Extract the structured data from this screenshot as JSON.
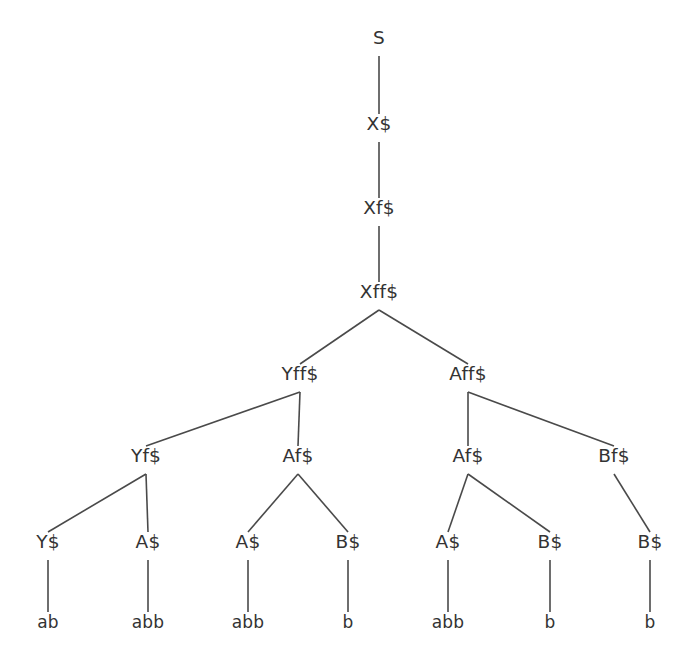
{
  "figure": {
    "type": "derivation-tree",
    "title": "",
    "background_color": "#ffffff",
    "text_color": "#333333",
    "edge_color": "#4a4a4a",
    "width": 687,
    "height": 662
  },
  "tree": {
    "levels": [
      {
        "index": 0,
        "y": 44,
        "nodes": [
          {
            "id": "n0",
            "label": "S",
            "x": 379
          }
        ]
      },
      {
        "index": 1,
        "y": 130,
        "nodes": [
          {
            "id": "n1",
            "label": "X$",
            "x": 379
          }
        ]
      },
      {
        "index": 2,
        "y": 214,
        "nodes": [
          {
            "id": "n2",
            "label": "Xf$",
            "x": 379
          }
        ]
      },
      {
        "index": 3,
        "y": 298,
        "nodes": [
          {
            "id": "n3",
            "label": "Xff$",
            "x": 379
          }
        ]
      },
      {
        "index": 4,
        "y": 380,
        "nodes": [
          {
            "id": "n4",
            "label": "Yff$",
            "x": 300
          },
          {
            "id": "n5",
            "label": "Aff$",
            "x": 468
          }
        ]
      },
      {
        "index": 5,
        "y": 462,
        "nodes": [
          {
            "id": "n6",
            "label": "Yf$",
            "x": 146
          },
          {
            "id": "n7",
            "label": "Af$",
            "x": 298
          },
          {
            "id": "n8",
            "label": "Af$",
            "x": 468
          },
          {
            "id": "n9",
            "label": "Bf$",
            "x": 614
          }
        ]
      },
      {
        "index": 6,
        "y": 548,
        "nodes": [
          {
            "id": "n10",
            "label": "Y$",
            "x": 48
          },
          {
            "id": "n11",
            "label": "A$",
            "x": 148
          },
          {
            "id": "n12",
            "label": "A$",
            "x": 248
          },
          {
            "id": "n13",
            "label": "B$",
            "x": 348
          },
          {
            "id": "n14",
            "label": "A$",
            "x": 448
          },
          {
            "id": "n15",
            "label": "B$",
            "x": 550
          },
          {
            "id": "n16",
            "label": "B$",
            "x": 650
          }
        ]
      },
      {
        "index": 7,
        "y": 628,
        "nodes": [
          {
            "id": "n17",
            "label": "ab",
            "x": 48
          },
          {
            "id": "n18",
            "label": "abb",
            "x": 148
          },
          {
            "id": "n19",
            "label": "abb",
            "x": 248
          },
          {
            "id": "n20",
            "label": "b",
            "x": 348
          },
          {
            "id": "n21",
            "label": "abb",
            "x": 448
          },
          {
            "id": "n22",
            "label": "b",
            "x": 550
          },
          {
            "id": "n23",
            "label": "b",
            "x": 650
          }
        ]
      }
    ],
    "edges": [
      {
        "from": "n0",
        "to": "n1"
      },
      {
        "from": "n1",
        "to": "n2"
      },
      {
        "from": "n2",
        "to": "n3"
      },
      {
        "from": "n3",
        "to": "n4"
      },
      {
        "from": "n3",
        "to": "n5"
      },
      {
        "from": "n4",
        "to": "n6"
      },
      {
        "from": "n4",
        "to": "n7"
      },
      {
        "from": "n5",
        "to": "n8"
      },
      {
        "from": "n5",
        "to": "n9"
      },
      {
        "from": "n6",
        "to": "n10"
      },
      {
        "from": "n6",
        "to": "n11"
      },
      {
        "from": "n7",
        "to": "n12"
      },
      {
        "from": "n7",
        "to": "n13"
      },
      {
        "from": "n8",
        "to": "n14"
      },
      {
        "from": "n8",
        "to": "n15"
      },
      {
        "from": "n9",
        "to": "n16"
      },
      {
        "from": "n10",
        "to": "n17"
      },
      {
        "from": "n11",
        "to": "n18"
      },
      {
        "from": "n12",
        "to": "n19"
      },
      {
        "from": "n13",
        "to": "n20"
      },
      {
        "from": "n14",
        "to": "n21"
      },
      {
        "from": "n15",
        "to": "n22"
      },
      {
        "from": "n16",
        "to": "n23"
      }
    ]
  }
}
